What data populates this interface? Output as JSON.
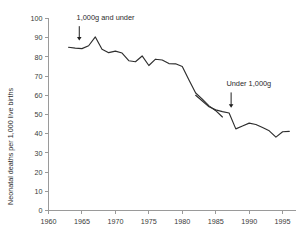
{
  "chart_data": {
    "type": "line",
    "title": "",
    "subtitle": "",
    "xlabel": "",
    "ylabel": "Neonatal deaths per 1,000 live births",
    "xlim": [
      1960,
      1997
    ],
    "ylim": [
      0,
      100
    ],
    "grid": false,
    "legend_position": "none",
    "xticks": [
      1960,
      1965,
      1970,
      1975,
      1980,
      1985,
      1990,
      1995
    ],
    "xtick_labels": [
      "1960",
      "1965",
      "1970",
      "1975",
      "1980",
      "1985",
      "1990",
      "1995"
    ],
    "yticks": [
      0,
      10,
      20,
      30,
      40,
      50,
      60,
      70,
      80,
      90,
      100
    ],
    "ytick_labels": [
      "0",
      "10",
      "20",
      "30",
      "40",
      "50",
      "60",
      "70",
      "80",
      "90",
      "100"
    ],
    "series": [
      {
        "name": "1,000g and under",
        "color": "#2e2e2e",
        "x": [
          1963,
          1964,
          1965,
          1966,
          1967,
          1968,
          1969,
          1970,
          1971,
          1972,
          1973,
          1974,
          1975,
          1976,
          1977,
          1978,
          1979,
          1980,
          1981,
          1982,
          1983,
          1984,
          1985,
          1986
        ],
        "values": [
          85.0,
          84.6,
          84.3,
          85.8,
          90.4,
          84.0,
          82.2,
          83.0,
          82.0,
          78.0,
          77.5,
          80.5,
          75.5,
          78.8,
          78.4,
          76.5,
          76.4,
          75.0,
          68.0,
          61.2,
          58.0,
          54.5,
          52.0,
          48.7
        ]
      },
      {
        "name": "Under 1,000g",
        "color": "#2e2e2e",
        "x": [
          1982,
          1983,
          1984,
          1985,
          1986,
          1987,
          1988,
          1989,
          1990,
          1991,
          1992,
          1993,
          1994,
          1995,
          1996
        ],
        "values": [
          60.0,
          57.0,
          54.0,
          52.4,
          51.5,
          50.8,
          42.5,
          44.0,
          45.5,
          44.8,
          43.2,
          41.5,
          38.2,
          41.0,
          41.2
        ]
      }
    ],
    "annotations": [
      {
        "id": "annotation-1000g-and-under",
        "text": "1,000g and under",
        "label_x": 1964.2,
        "label_y": 99.0,
        "arrow_x": 1964.6,
        "arrow_from_y": 96.0,
        "arrow_to_y": 88.5
      },
      {
        "id": "annotation-under-1000g",
        "text": "Under 1,000g",
        "label_x": 1986.6,
        "label_y": 65.0,
        "arrow_x": 1987.3,
        "arrow_from_y": 61.5,
        "arrow_to_y": 53.5
      }
    ]
  }
}
